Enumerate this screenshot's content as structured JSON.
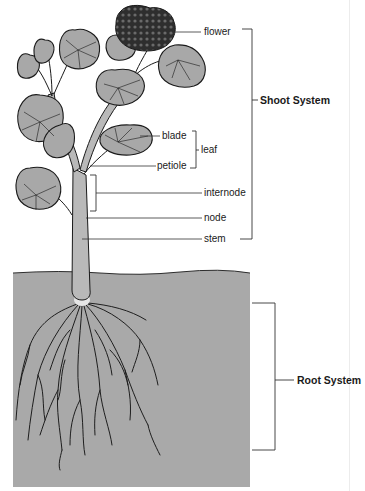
{
  "colors": {
    "leaf_fill": "#a8a8a8",
    "soil_fill": "#a9a9a9",
    "outline": "#1a1a1a",
    "flower_fill": "#3a3a3a",
    "stem_fill": "#b5b5b5",
    "leader_line": "#333333"
  },
  "labels": {
    "flower": "flower",
    "blade": "blade",
    "leaf": "leaf",
    "petiole": "petiole",
    "internode": "internode",
    "node": "node",
    "stem": "stem",
    "shoot_system": "Shoot System",
    "root_system": "Root System"
  },
  "groups": [
    {
      "name": "Shoot System",
      "members": [
        "flower",
        "leaf",
        "internode",
        "node",
        "stem"
      ]
    },
    {
      "name": "leaf",
      "members": [
        "blade",
        "petiole"
      ]
    },
    {
      "name": "Root System",
      "members": [
        "roots"
      ]
    }
  ]
}
